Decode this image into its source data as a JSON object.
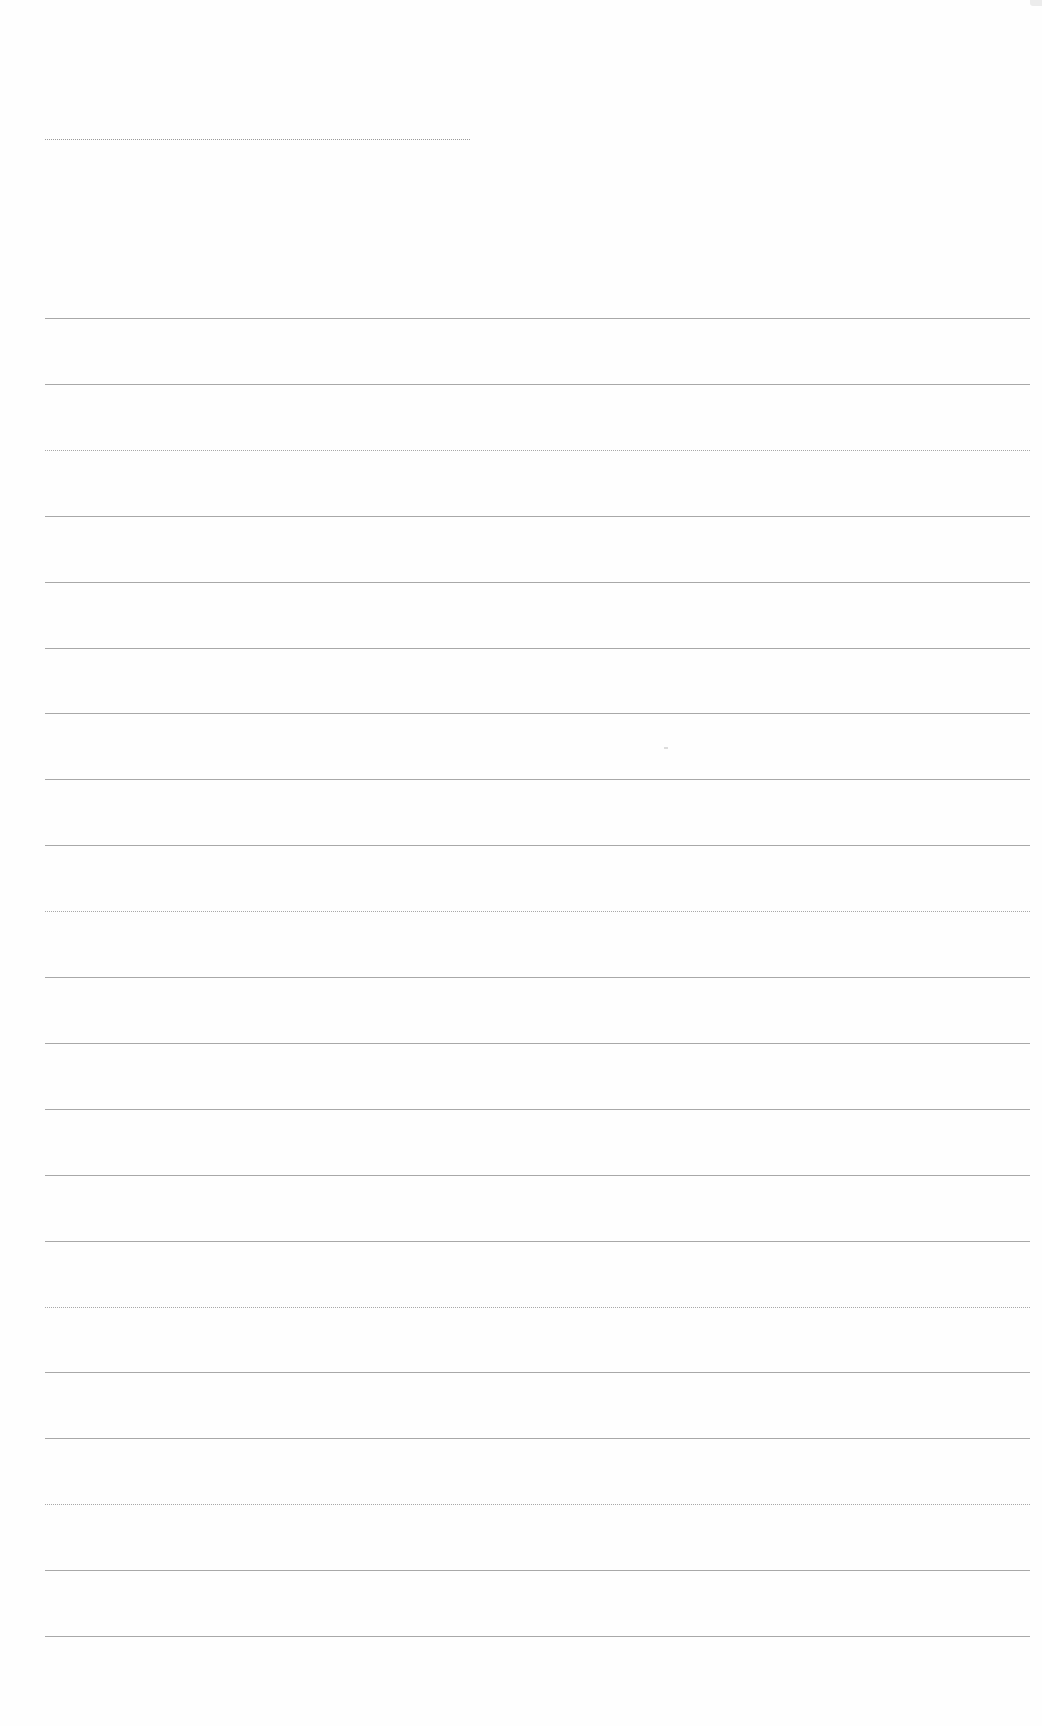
{
  "document": {
    "type": "blank-lined-page",
    "title_line": {
      "left": 45,
      "top": 139,
      "width": 425,
      "style": "dotted"
    },
    "rules": {
      "count": 21,
      "left": 45,
      "width": 985,
      "first_top": 318,
      "spacing": 65.9,
      "color": "#a8a8a8",
      "dotted_indices": [
        2,
        9,
        15,
        18
      ]
    }
  },
  "colors": {
    "background": "#fefefe",
    "line": "#a8a8a8"
  }
}
